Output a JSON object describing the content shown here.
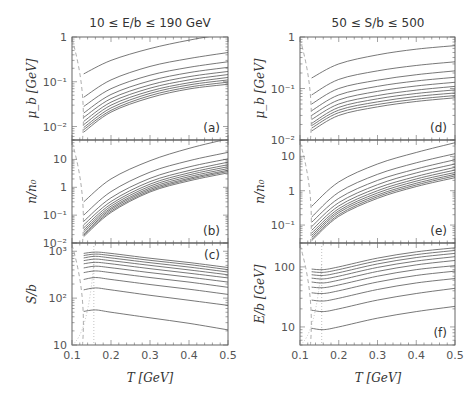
{
  "chart_data": [
    {
      "type": "line",
      "title": "10 ≤ E/b ≤ 190 GeV",
      "column": "left",
      "xlabel": "T [GeV]",
      "xlim": [
        0.1,
        0.5
      ],
      "xticks": [
        "0.1",
        "0.2",
        "0.3",
        "0.4",
        "0.5"
      ],
      "panels": [
        {
          "id": "a",
          "label": "(a)",
          "ylabel": "μ_b [GeV]",
          "yscale": "log",
          "ylim": [
            0.005,
            1
          ],
          "yticks": [
            {
              "v": 1,
              "t": "1"
            },
            {
              "v": 0.1,
              "t": "10⁻¹"
            },
            {
              "v": 0.01,
              "t": "10⁻²"
            }
          ],
          "x": [
            0.13,
            0.2,
            0.3,
            0.4,
            0.5
          ],
          "series": [
            {
              "name": "E/b=10",
              "values": [
                0.15,
                0.3,
                0.55,
                0.85,
                1.2
              ]
            },
            {
              "name": "E/b=30",
              "values": [
                0.045,
                0.11,
                0.22,
                0.33,
                0.45
              ]
            },
            {
              "name": "E/b=50",
              "values": [
                0.028,
                0.07,
                0.14,
                0.21,
                0.28
              ]
            },
            {
              "name": "E/b=70",
              "values": [
                0.02,
                0.052,
                0.105,
                0.16,
                0.21
              ]
            },
            {
              "name": "E/b=90",
              "values": [
                0.016,
                0.042,
                0.085,
                0.13,
                0.17
              ]
            },
            {
              "name": "E/b=110",
              "values": [
                0.013,
                0.035,
                0.072,
                0.11,
                0.145
              ]
            },
            {
              "name": "E/b=130",
              "values": [
                0.011,
                0.03,
                0.062,
                0.095,
                0.125
              ]
            },
            {
              "name": "E/b=150",
              "values": [
                0.0095,
                0.026,
                0.055,
                0.085,
                0.11
              ]
            },
            {
              "name": "E/b=170",
              "values": [
                0.0085,
                0.023,
                0.049,
                0.076,
                0.098
              ]
            },
            {
              "name": "E/b=190",
              "values": [
                0.0075,
                0.021,
                0.044,
                0.069,
                0.088
              ]
            }
          ]
        },
        {
          "id": "b",
          "label": "(b)",
          "ylabel": "n/n₀",
          "yscale": "log",
          "ylim": [
            0.01,
            50
          ],
          "yticks": [
            {
              "v": 10,
              "t": "10"
            },
            {
              "v": 1,
              "t": "1"
            },
            {
              "v": 0.1,
              "t": "10⁻¹"
            },
            {
              "v": 0.01,
              "t": "10⁻²"
            }
          ],
          "x": [
            0.13,
            0.2,
            0.3,
            0.4,
            0.5
          ],
          "series": [
            {
              "name": "E/b=10",
              "values": [
                0.3,
                2.0,
                9,
                25,
                55
              ]
            },
            {
              "name": "E/b=30",
              "values": [
                0.1,
                0.7,
                3.5,
                9,
                18
              ]
            },
            {
              "name": "E/b=50",
              "values": [
                0.06,
                0.42,
                2.1,
                5.4,
                10.5
              ]
            },
            {
              "name": "E/b=70",
              "values": [
                0.045,
                0.31,
                1.6,
                4.0,
                8.0
              ]
            },
            {
              "name": "E/b=90",
              "values": [
                0.035,
                0.25,
                1.3,
                3.3,
                6.5
              ]
            },
            {
              "name": "E/b=110",
              "values": [
                0.029,
                0.21,
                1.1,
                2.8,
                5.5
              ]
            },
            {
              "name": "E/b=130",
              "values": [
                0.025,
                0.18,
                0.95,
                2.4,
                4.7
              ]
            },
            {
              "name": "E/b=150",
              "values": [
                0.021,
                0.16,
                0.84,
                2.1,
                4.1
              ]
            },
            {
              "name": "E/b=170",
              "values": [
                0.019,
                0.14,
                0.75,
                1.9,
                3.7
              ]
            },
            {
              "name": "E/b=190",
              "values": [
                0.017,
                0.125,
                0.68,
                1.7,
                3.3
              ]
            }
          ]
        },
        {
          "id": "c",
          "label": "(c)",
          "ylabel": "S/b",
          "yscale": "log",
          "ylim": [
            10,
            1500
          ],
          "yticks": [
            {
              "v": 1000,
              "t": "10³"
            },
            {
              "v": 100,
              "t": "10²"
            },
            {
              "v": 10,
              "t": "10"
            }
          ],
          "x": [
            0.13,
            0.16,
            0.2,
            0.3,
            0.4,
            0.5
          ],
          "series": [
            {
              "name": "E/b=10",
              "values": [
                52,
                56,
                50,
                38,
                29,
                21
              ]
            },
            {
              "name": "E/b=30",
              "values": [
                150,
                165,
                150,
                115,
                90,
                70
              ]
            },
            {
              "name": "E/b=50",
              "values": [
                250,
                275,
                250,
                195,
                155,
                120
              ]
            },
            {
              "name": "E/b=70",
              "values": [
                350,
                380,
                350,
                275,
                220,
                170
              ]
            },
            {
              "name": "E/b=90",
              "values": [
                440,
                480,
                445,
                350,
                280,
                220
              ]
            },
            {
              "name": "E/b=110",
              "values": [
                540,
                580,
                540,
                425,
                340,
                270
              ]
            },
            {
              "name": "E/b=130",
              "values": [
                630,
                680,
                630,
                500,
                400,
                315
              ]
            },
            {
              "name": "E/b=150",
              "values": [
                720,
                780,
                720,
                570,
                460,
                360
              ]
            },
            {
              "name": "E/b=170",
              "values": [
                810,
                870,
                810,
                640,
                520,
                405
              ]
            },
            {
              "name": "E/b=190",
              "values": [
                900,
                960,
                900,
                710,
                575,
                450
              ]
            }
          ]
        }
      ]
    },
    {
      "type": "line",
      "title": "50 ≤ S/b ≤ 500",
      "column": "right",
      "xlabel": "T [GeV]",
      "xlim": [
        0.1,
        0.5
      ],
      "xticks": [
        "0.1",
        "0.2",
        "0.3",
        "0.4",
        "0.5"
      ],
      "panels": [
        {
          "id": "d",
          "label": "(d)",
          "ylabel": "μ_b [GeV]",
          "yscale": "log",
          "ylim": [
            0.01,
            1
          ],
          "yticks": [
            {
              "v": 1,
              "t": "1"
            },
            {
              "v": 0.1,
              "t": "10⁻¹"
            },
            {
              "v": 0.01,
              "t": "10⁻²"
            }
          ],
          "x": [
            0.13,
            0.2,
            0.3,
            0.4,
            0.5
          ],
          "series": [
            {
              "name": "S/b=50",
              "values": [
                0.16,
                0.3,
                0.45,
                0.58,
                0.68
              ]
            },
            {
              "name": "S/b=100",
              "values": [
                0.075,
                0.15,
                0.22,
                0.28,
                0.33
              ]
            },
            {
              "name": "S/b=150",
              "values": [
                0.05,
                0.1,
                0.145,
                0.185,
                0.22
              ]
            },
            {
              "name": "S/b=200",
              "values": [
                0.037,
                0.075,
                0.11,
                0.14,
                0.165
              ]
            },
            {
              "name": "S/b=250",
              "values": [
                0.03,
                0.06,
                0.088,
                0.112,
                0.132
              ]
            },
            {
              "name": "S/b=300",
              "values": [
                0.025,
                0.05,
                0.073,
                0.093,
                0.11
              ]
            },
            {
              "name": "S/b=350",
              "values": [
                0.021,
                0.043,
                0.063,
                0.08,
                0.094
              ]
            },
            {
              "name": "S/b=400",
              "values": [
                0.019,
                0.038,
                0.055,
                0.07,
                0.082
              ]
            },
            {
              "name": "S/b=450",
              "values": [
                0.017,
                0.034,
                0.049,
                0.062,
                0.073
              ]
            },
            {
              "name": "S/b=500",
              "values": [
                0.015,
                0.03,
                0.044,
                0.056,
                0.066
              ]
            }
          ]
        },
        {
          "id": "e",
          "label": "(e)",
          "ylabel": "n/n₀",
          "yscale": "log",
          "ylim": [
            0.03,
            30
          ],
          "yticks": [
            {
              "v": 10,
              "t": "10"
            },
            {
              "v": 1,
              "t": "1"
            },
            {
              "v": 0.1,
              "t": "10⁻¹"
            }
          ],
          "x": [
            0.13,
            0.2,
            0.3,
            0.4,
            0.5
          ],
          "series": [
            {
              "name": "S/b=50",
              "values": [
                0.35,
                1.8,
                6,
                13,
                25
              ]
            },
            {
              "name": "S/b=100",
              "values": [
                0.17,
                0.9,
                3,
                6.5,
                12
              ]
            },
            {
              "name": "S/b=150",
              "values": [
                0.12,
                0.6,
                2,
                4.3,
                8
              ]
            },
            {
              "name": "S/b=200",
              "values": [
                0.09,
                0.45,
                1.5,
                3.3,
                6
              ]
            },
            {
              "name": "S/b=250",
              "values": [
                0.07,
                0.36,
                1.2,
                2.6,
                4.8
              ]
            },
            {
              "name": "S/b=300",
              "values": [
                0.058,
                0.3,
                1.0,
                2.2,
                4.0
              ]
            },
            {
              "name": "S/b=350",
              "values": [
                0.05,
                0.26,
                0.86,
                1.9,
                3.4
              ]
            },
            {
              "name": "S/b=400",
              "values": [
                0.044,
                0.23,
                0.75,
                1.65,
                3.0
              ]
            },
            {
              "name": "S/b=450",
              "values": [
                0.039,
                0.2,
                0.67,
                1.47,
                2.7
              ]
            },
            {
              "name": "S/b=500",
              "values": [
                0.035,
                0.18,
                0.6,
                1.32,
                2.4
              ]
            }
          ]
        },
        {
          "id": "f",
          "label": "(f)",
          "ylabel": "E/b [GeV]",
          "yscale": "log",
          "ylim": [
            5,
            250
          ],
          "yticks": [
            {
              "v": 100,
              "t": "100"
            },
            {
              "v": 10,
              "t": "10"
            }
          ],
          "x": [
            0.13,
            0.16,
            0.2,
            0.3,
            0.4,
            0.5
          ],
          "series": [
            {
              "name": "S/b=50",
              "values": [
                9.5,
                9,
                10,
                14,
                18,
                22
              ]
            },
            {
              "name": "S/b=100",
              "values": [
                19,
                18,
                20,
                28,
                36,
                44
              ]
            },
            {
              "name": "S/b=150",
              "values": [
                28,
                27,
                30,
                42,
                54,
                64
              ]
            },
            {
              "name": "S/b=200",
              "values": [
                37,
                36,
                40,
                56,
                72,
                85
              ]
            },
            {
              "name": "S/b=250",
              "values": [
                46,
                45,
                50,
                70,
                90,
                105
              ]
            },
            {
              "name": "S/b=300",
              "values": [
                56,
                54,
                60,
                84,
                108,
                128
              ]
            },
            {
              "name": "S/b=350",
              "values": [
                65,
                63,
                70,
                98,
                125,
                148
              ]
            },
            {
              "name": "S/b=400",
              "values": [
                74,
                72,
                80,
                112,
                143,
                168
              ]
            },
            {
              "name": "S/b=450",
              "values": [
                83,
                81,
                90,
                126,
                160,
                188
              ]
            },
            {
              "name": "S/b=500",
              "values": [
                92,
                90,
                100,
                140,
                178,
                208
              ]
            }
          ]
        }
      ]
    }
  ]
}
